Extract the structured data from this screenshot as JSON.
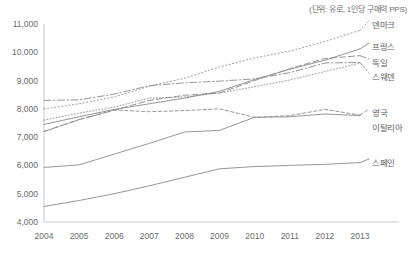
{
  "unit_note": "(단위: 유로, 1인당 구매력 PPS)",
  "axis": {
    "y_ticks": [
      "11,000",
      "10,000",
      "9,000",
      "8,000",
      "7,000",
      "6,000",
      "5,000",
      "4,000"
    ],
    "x_ticks": [
      "2004",
      "2005",
      "2006",
      "2007",
      "2008",
      "2009",
      "2010",
      "2011",
      "2012",
      "2013"
    ]
  },
  "labels": {
    "denmark": "덴마크",
    "france": "프랑스",
    "germany": "독일",
    "sweden": "스웨덴",
    "uk": "영국",
    "italy": "이탈리아",
    "spain": "스페인"
  },
  "chart_data": {
    "type": "line",
    "title": "",
    "subtitle": "",
    "xlabel": "",
    "ylabel": "",
    "annotations": [
      "(단위: 유로, 1인당 구매력 PPS)"
    ],
    "grid": false,
    "legend_position": "right-inline-labels",
    "ylim": [
      4000,
      11000
    ],
    "ytick_step": 1000,
    "x": [
      2004,
      2005,
      2006,
      2007,
      2008,
      2009,
      2010,
      2011,
      2012,
      2013
    ],
    "categories": [
      "2004",
      "2005",
      "2006",
      "2007",
      "2008",
      "2009",
      "2010",
      "2011",
      "2012",
      "2013"
    ],
    "series": [
      {
        "name": "덴마크",
        "name_en": "Denmark",
        "style": "dotted",
        "color": "#9a9a9a",
        "values": [
          8000,
          8180,
          8420,
          8800,
          9080,
          9480,
          9800,
          10040,
          10380,
          10780
        ]
      },
      {
        "name": "프랑스",
        "name_en": "France",
        "style": "solid-thin",
        "color": "#9a9a9a",
        "values": [
          7450,
          7720,
          7980,
          8180,
          8380,
          8620,
          9040,
          9400,
          9720,
          10120
        ]
      },
      {
        "name": "독일",
        "name_en": "Germany",
        "style": "dashed",
        "color": "#8a8a8a",
        "values": [
          7200,
          7620,
          7950,
          8300,
          8480,
          8560,
          9000,
          9420,
          9780,
          9880
        ]
      },
      {
        "name": "스웨덴",
        "name_en": "Sweden",
        "style": "dash-dot",
        "color": "#8a8a8a",
        "values": [
          8300,
          8320,
          8520,
          8820,
          8920,
          8980,
          9060,
          9280,
          9620,
          9640
        ]
      },
      {
        "name": "영국",
        "name_en": "United Kingdom",
        "style": "dotted-fine",
        "color": "#a5a5a5",
        "values": [
          7600,
          7850,
          8060,
          8380,
          8420,
          8560,
          8780,
          9020,
          9320,
          9620
        ]
      },
      {
        "name": "이탈리아",
        "name_en": "Italy",
        "style": "short-dash",
        "color": "#8a8a8a",
        "values": [
          7200,
          7620,
          7960,
          7900,
          7940,
          8000,
          7700,
          7760,
          7980,
          7780
        ]
      },
      {
        "name": "스페인",
        "name_en": "Spain",
        "style": "solid",
        "color": "#8a8a8a",
        "values": [
          5930,
          6020,
          6400,
          6780,
          7180,
          7240,
          7700,
          7720,
          7820,
          7760
        ]
      },
      {
        "name": "스페인-low",
        "name_en": "Spain-lower",
        "style": "solid",
        "color": "#8a8a8a",
        "values": [
          4550,
          4760,
          5000,
          5280,
          5580,
          5880,
          5960,
          6000,
          6040,
          6100
        ]
      }
    ]
  }
}
